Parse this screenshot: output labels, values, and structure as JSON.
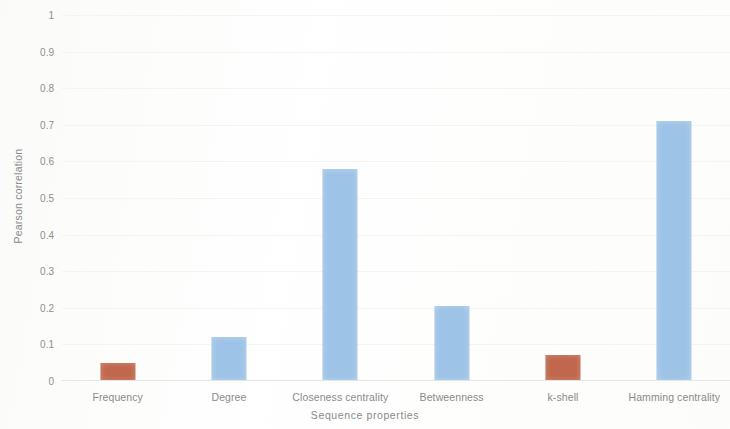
{
  "chart_data": {
    "type": "bar",
    "title": "",
    "xlabel": "Sequence properties",
    "ylabel": "Pearson correlation",
    "categories": [
      "Frequency",
      "Degree",
      "Closeness centrality",
      "Betweenness",
      "k-shell",
      "Hamming centrality"
    ],
    "values": [
      0.05,
      0.12,
      0.58,
      0.205,
      0.07,
      0.71
    ],
    "bar_colors": [
      "#c0674d",
      "#9dc3e6",
      "#9dc3e6",
      "#9dc3e6",
      "#c0674d",
      "#9dc3e6"
    ],
    "ylim": [
      0,
      1
    ],
    "ytick_labels": [
      "1",
      "0.9",
      "0.8",
      "0.7",
      "0.6",
      "0.5",
      "0.4",
      "0.3",
      "0.2",
      "0.1",
      "0"
    ],
    "ytick_values": [
      1,
      0.9,
      0.8,
      0.7,
      0.6,
      0.5,
      0.4,
      0.3,
      0.2,
      0.1,
      0
    ],
    "grid": true,
    "legend": null,
    "accent_blue": "#9dc3e6",
    "accent_orange": "#c0674d"
  }
}
